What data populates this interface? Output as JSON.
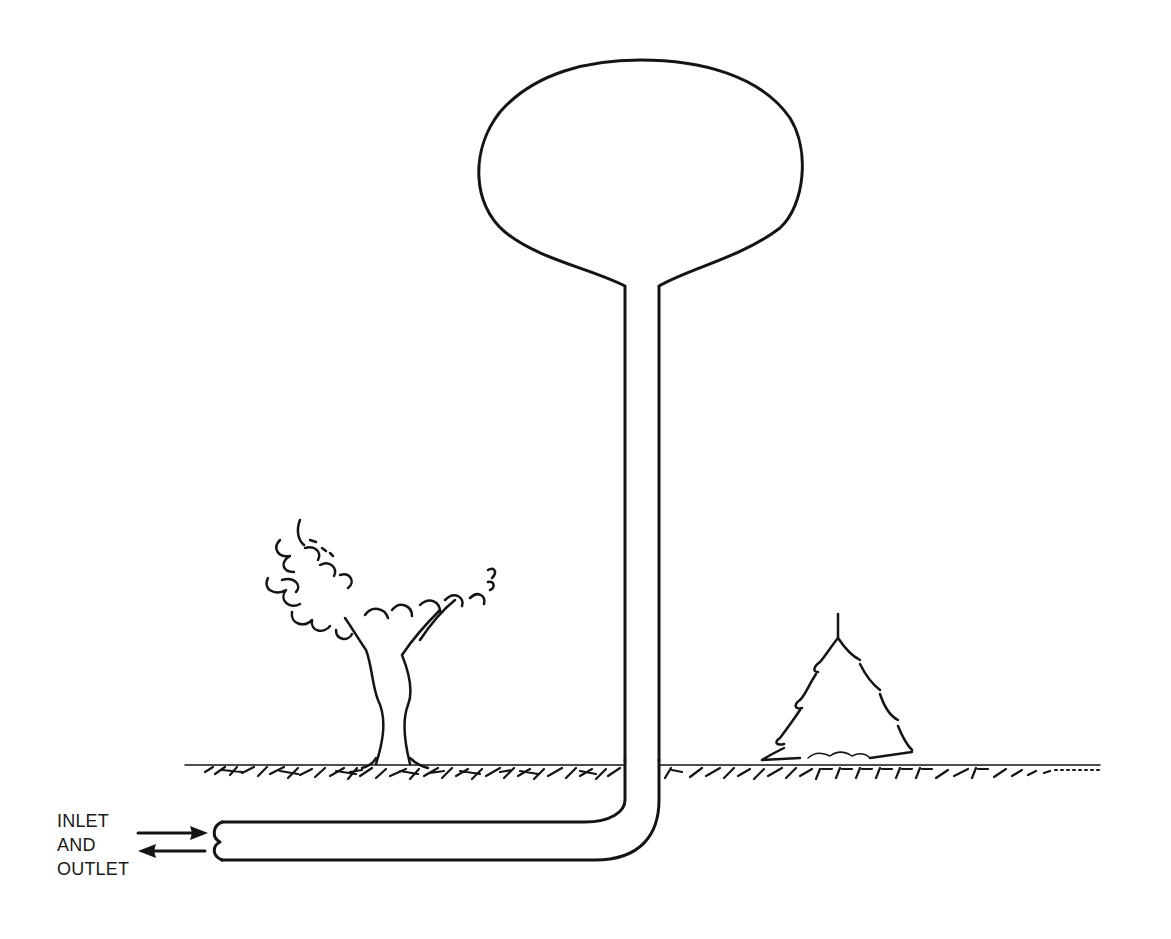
{
  "diagram": {
    "colors": {
      "ink": "#141414",
      "background": "#ffffff"
    },
    "components": {
      "tank": "spherical tank",
      "riser": "vertical riser pipe",
      "pipe": "underground horizontal pipe",
      "ground": "ground line with hatching",
      "deciduous_tree": "tree",
      "evergreen_tree": "pine tree"
    },
    "label": {
      "lines": [
        "INLET",
        "AND",
        "OUTLET"
      ]
    },
    "arrows": [
      {
        "direction": "right",
        "meaning": "inlet flow"
      },
      {
        "direction": "left",
        "meaning": "outlet flow"
      }
    ]
  }
}
